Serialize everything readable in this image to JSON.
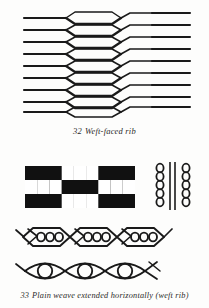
{
  "page": {
    "background_color": "#fdfdfc",
    "ink_color": "#1a1a1a",
    "width": 209,
    "height": 308
  },
  "figures": [
    {
      "id": "32",
      "number": "32",
      "caption_text": "Weft-faced rib",
      "caption_full": "32  Weft-faced rib",
      "type": "weaving-interlacement-diagram",
      "weft_rows": 9,
      "warp_columns": 3,
      "description": "Horizontal weft threads passing over and under widely spaced warp ends, opening into elongated hexagonal lenses"
    },
    {
      "id": "33",
      "number": "33",
      "caption_text": "Plain weave extended horizontally (weft rib)",
      "caption_full": "33  Plain weave extended horizontally (weft rib)",
      "type": "weave-draft-and-interlacement",
      "grid": {
        "columns": 9,
        "rows": 3,
        "filled_color": "#111111",
        "empty_color": "#ffffff",
        "cells": [
          [
            1,
            1,
            1,
            0,
            0,
            0,
            1,
            1,
            1
          ],
          [
            0,
            0,
            0,
            1,
            1,
            1,
            0,
            0,
            0
          ],
          [
            1,
            1,
            1,
            0,
            0,
            0,
            1,
            1,
            1
          ]
        ]
      },
      "bead_columns": {
        "count": 2,
        "beads_per_column": 5,
        "divider_lines": 2
      },
      "middle_row": {
        "lens_count": 3,
        "circles_per_lens": 3
      },
      "bottom_row": {
        "lens_count": 3,
        "circles_per_lens": 1
      }
    }
  ]
}
